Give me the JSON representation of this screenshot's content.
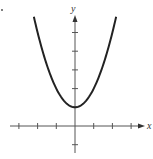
{
  "chart_data": {
    "type": "line",
    "title": "",
    "function": "y = x^2 + 1",
    "xlabel": "x",
    "ylabel": "y",
    "xlim": [
      -3.0,
      3.5
    ],
    "ylim": [
      -1.2,
      6.2
    ],
    "x_ticks": [
      -3,
      -2,
      -1,
      1,
      2,
      3
    ],
    "y_ticks": [
      -1,
      1,
      2,
      3,
      4,
      5
    ],
    "tick_labels_shown": false,
    "grid": false,
    "series": [
      {
        "name": "parabola",
        "x": [
          -2.2,
          -2,
          -1.5,
          -1,
          -0.5,
          0,
          0.5,
          1,
          1.5,
          2,
          2.2
        ],
        "y": [
          5.84,
          5,
          3.25,
          2,
          1.25,
          1,
          1.25,
          2,
          3.25,
          5,
          5.84
        ]
      }
    ],
    "vertex": [
      0,
      1
    ],
    "color": "#222222"
  },
  "labels": {
    "x_axis": "x",
    "y_axis": "y"
  }
}
